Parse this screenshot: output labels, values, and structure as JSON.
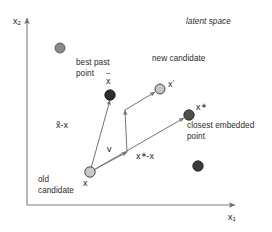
{
  "figure": {
    "title_note": "latent space",
    "axes": {
      "x_label_base": "x",
      "x_label_sub": "1",
      "y_label_base": "x",
      "y_label_sub": "2",
      "x_axis_from": [
        27,
        205
      ],
      "x_axis_to": [
        237,
        205
      ],
      "y_axis_from": [
        27,
        205
      ],
      "y_axis_to": [
        27,
        16
      ],
      "axis_color": "#777777"
    },
    "annotations": [
      {
        "name": "latent-space",
        "text": "latent space",
        "x": 186,
        "y": 17,
        "italic": true
      },
      {
        "name": "new-candidate",
        "text": "new candidate",
        "x": 152,
        "y": 54,
        "italic": false
      },
      {
        "name": "best-past-point",
        "text": "best past\npoint",
        "x": 76,
        "y": 58,
        "italic": false
      },
      {
        "name": "closest-embedded-point",
        "text": "closest embedded\npoint",
        "x": 187,
        "y": 121,
        "italic": false
      },
      {
        "name": "old-candidate",
        "text": "old\ncandidate",
        "x": 38,
        "y": 175,
        "italic": false
      }
    ],
    "math_labels": [
      {
        "name": "label-x-tilde",
        "x": 106,
        "y": 78,
        "base": "x",
        "tilde": true
      },
      {
        "name": "label-x-prime",
        "x": 168,
        "y": 80,
        "base": "x",
        "prime": true
      },
      {
        "name": "label-x-star",
        "x": 196,
        "y": 104,
        "base": "x",
        "star": true
      },
      {
        "name": "label-x",
        "x": 83,
        "y": 178,
        "base": "x"
      },
      {
        "name": "label-v",
        "x": 107,
        "y": 145,
        "base": "v"
      },
      {
        "name": "label-x-tilde-minus-x",
        "x": 56,
        "y": 122,
        "text": "x̃-x"
      },
      {
        "name": "label-x-star-minus-x",
        "x": 137,
        "y": 152,
        "text": "x*-x"
      }
    ],
    "points": [
      {
        "name": "point-scatter-upper-left",
        "x": 60,
        "y": 48,
        "r": 5.0,
        "fill": "#8a8a8a",
        "stroke": "#4a4a4a"
      },
      {
        "name": "point-x-tilde-best-past",
        "x": 110,
        "y": 95,
        "r": 5.2,
        "fill": "#2d2d2d",
        "stroke": "#1a1a1a"
      },
      {
        "name": "point-x-prime-new-candidate",
        "x": 160,
        "y": 89,
        "r": 5.0,
        "fill": "#c4c4c4",
        "stroke": "#4a4a4a"
      },
      {
        "name": "point-x-star-closest-embedded",
        "x": 189,
        "y": 115,
        "r": 5.2,
        "fill": "#4e4e4e",
        "stroke": "#2a2a2a"
      },
      {
        "name": "point-scatter-lower-right",
        "x": 198,
        "y": 166,
        "r": 5.2,
        "fill": "#3a3a3a",
        "stroke": "#222222"
      },
      {
        "name": "point-x-old-candidate",
        "x": 90,
        "y": 172,
        "r": 5.2,
        "fill": "#c9c9c9",
        "stroke": "#4a4a4a"
      }
    ],
    "vectors": [
      {
        "name": "vector-x-tilde-minus-x",
        "from": [
          90,
          172
        ],
        "to": [
          110,
          98
        ]
      },
      {
        "name": "vector-x-star-minus-x",
        "from": [
          90,
          172
        ],
        "to": [
          186,
          117
        ]
      },
      {
        "name": "vector-v-at-x",
        "from": [
          90,
          172
        ],
        "to": [
          128,
          151
        ]
      },
      {
        "name": "vector-v-transported",
        "from": [
          127,
          151
        ],
        "to": [
          125,
          109
        ]
      },
      {
        "name": "vector-transported-to-x-prime",
        "from": [
          125,
          109
        ],
        "to": [
          156,
          91
        ]
      }
    ],
    "colors": {
      "background": "#ffffff",
      "axis": "#777777",
      "vector": "#6e6e6e",
      "text": "#2b2b2b"
    }
  }
}
